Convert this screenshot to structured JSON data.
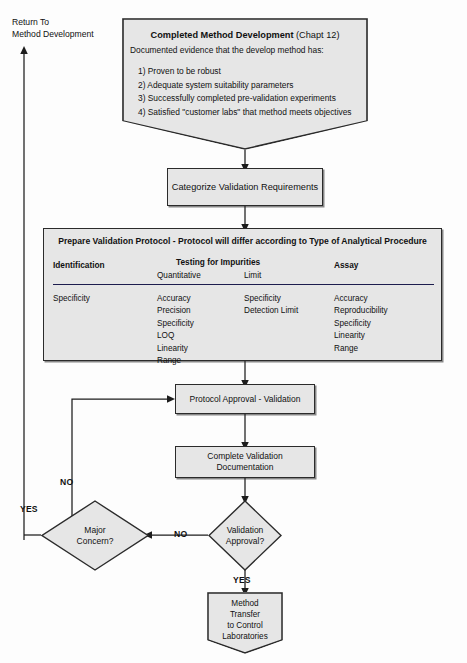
{
  "diagram": {
    "return_label": {
      "line1": "Return To",
      "line2": "Method Development"
    },
    "nodes": {
      "completed_method": {
        "heading_bold": "Completed Method Development",
        "heading_rest": " (Chapt 12)",
        "subtitle": "Documented evidence that the develop method has:",
        "items": [
          "1) Proven to be robust",
          "2) Adequate system suitability parameters",
          "3) Successfully completed pre-validation experiments",
          "4) Satisfied \"customer labs\" that method meets objectives"
        ]
      },
      "categorize": {
        "label": "Categorize Validation Requirements"
      },
      "protocol": {
        "title": "Prepare Validation Protocol - Protocol will differ according to Type of Analytical Procedure",
        "columns": [
          {
            "header": "Identification",
            "subheader": "",
            "items": [
              "Specificity"
            ]
          },
          {
            "header": "Testing for Impurities",
            "subheader": "Quantitative",
            "items": [
              "Accuracy",
              "Precision",
              "Specificity",
              "LOQ",
              "Linearity",
              "Range"
            ]
          },
          {
            "header": "",
            "subheader": "Limit",
            "items": [
              "Specificity",
              "Detection Limit"
            ]
          },
          {
            "header": "Assay",
            "subheader": "",
            "items": [
              "Accuracy",
              "Reproducibility",
              "Specificity",
              "Linearity",
              "Range"
            ]
          }
        ]
      },
      "protocol_approval": {
        "label": "Protocol Approval - Validation"
      },
      "complete_documentation": {
        "line1": "Complete Validation",
        "line2": "Documentation"
      },
      "validation_approval": {
        "line1": "Validation",
        "line2": "Approval?"
      },
      "major_concern": {
        "line1": "Major",
        "line2": "Concern?"
      },
      "method_transfer": {
        "line1": "Method",
        "line2": "Transfer",
        "line3": "to Control",
        "line4": "Laboratories"
      }
    },
    "edge_labels": {
      "validation_no": "NO",
      "validation_yes": "YES",
      "concern_no": "NO",
      "concern_yes": "YES"
    },
    "colors": {
      "box_fill": "#e6e6e6",
      "stroke": "#2b2b2b",
      "rule": "#1d1d4e",
      "text": "#111111",
      "page_bg": "#fdfdfd"
    }
  }
}
